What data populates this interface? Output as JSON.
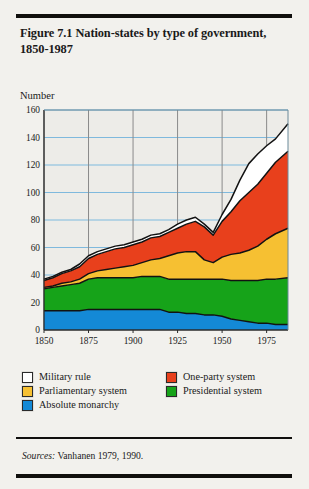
{
  "figure": {
    "title": "Figure 7.1  Nation-states by type of government, 1850-1987",
    "source_prefix": "Sources:",
    "source_text": " Vanhanen 1979, 1990."
  },
  "legend": [
    {
      "label": "Military rule",
      "color": "#ffffff",
      "key": "military"
    },
    {
      "label": "One-party system",
      "color": "#e8401c",
      "key": "one_party"
    },
    {
      "label": "Parliamentary system",
      "color": "#f6c032",
      "key": "parliamentary"
    },
    {
      "label": "Presidential system",
      "color": "#16a319",
      "key": "presidential"
    },
    {
      "label": "Absolute monarchy",
      "color": "#1489d6",
      "key": "monarchy"
    }
  ],
  "chart_data": {
    "type": "area",
    "stacked": true,
    "title": "Figure 7.1  Nation-states by type of government, 1850-1987",
    "xlabel": "",
    "ylabel": "Number",
    "xlim": [
      1850,
      1987
    ],
    "ylim": [
      0,
      160
    ],
    "ytick_step": 20,
    "yticks": [
      0,
      20,
      40,
      60,
      80,
      100,
      120,
      140,
      160
    ],
    "xticks": [
      1850,
      1875,
      1900,
      1925,
      1950,
      1975
    ],
    "grid": "horizontal-and-vertical",
    "gridline_color_h": "#7fb9dd",
    "gridline_color_v": "#8a8a8a",
    "legend_position": "below-plot",
    "x": [
      1850,
      1855,
      1860,
      1865,
      1870,
      1875,
      1880,
      1885,
      1890,
      1895,
      1900,
      1905,
      1910,
      1915,
      1920,
      1925,
      1930,
      1935,
      1940,
      1945,
      1950,
      1955,
      1960,
      1965,
      1970,
      1975,
      1980,
      1987
    ],
    "series": [
      {
        "name": "Absolute monarchy",
        "color": "#1489d6",
        "values": [
          14,
          14,
          14,
          14,
          14,
          15,
          15,
          15,
          15,
          15,
          15,
          15,
          15,
          15,
          13,
          13,
          12,
          12,
          11,
          11,
          10,
          8,
          7,
          6,
          5,
          5,
          4,
          4
        ]
      },
      {
        "name": "Presidential system",
        "color": "#16a319",
        "values": [
          16,
          17,
          18,
          19,
          20,
          22,
          23,
          23,
          23,
          23,
          23,
          24,
          24,
          24,
          24,
          24,
          25,
          25,
          26,
          26,
          27,
          28,
          29,
          30,
          31,
          32,
          33,
          34
        ]
      },
      {
        "name": "Parliamentary system",
        "color": "#f6c032",
        "values": [
          1,
          1,
          2,
          2,
          3,
          4,
          5,
          6,
          7,
          8,
          9,
          10,
          12,
          13,
          17,
          19,
          20,
          20,
          14,
          12,
          16,
          19,
          20,
          22,
          25,
          29,
          33,
          36
        ]
      },
      {
        "name": "One-party system",
        "color": "#e8401c",
        "values": [
          5,
          6,
          7,
          8,
          9,
          11,
          12,
          13,
          14,
          14,
          15,
          15,
          16,
          16,
          17,
          18,
          20,
          22,
          24,
          20,
          26,
          31,
          38,
          42,
          45,
          48,
          52,
          56
        ]
      },
      {
        "name": "Military rule",
        "color": "#ffffff",
        "values": [
          1,
          1,
          1,
          1,
          2,
          2,
          2,
          2,
          2,
          2,
          2,
          2,
          2,
          2,
          2,
          3,
          3,
          3,
          2,
          2,
          5,
          9,
          15,
          21,
          22,
          20,
          17,
          20
        ]
      }
    ],
    "totals_note": "Totals rise from about 37 in 1850 to about 150 by 1987"
  }
}
